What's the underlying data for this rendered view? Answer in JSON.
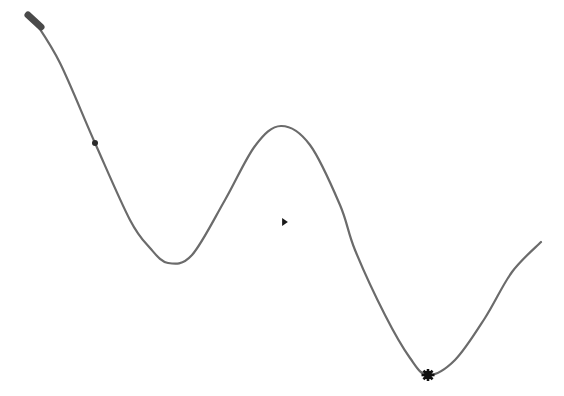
{
  "canvas": {
    "width": 564,
    "height": 396,
    "background_color": "#ffffff",
    "title": ""
  },
  "chart_data": {
    "type": "line",
    "title": "",
    "subtitle": "",
    "xlabel": "",
    "ylabel": "",
    "grid": false,
    "legend": false,
    "legend_position": "none",
    "axes_visible": false,
    "tick_labels_x": [],
    "tick_labels_y": [],
    "xlim": [
      0,
      564
    ],
    "ylim": [
      396,
      0
    ],
    "series": [
      {
        "name": "curve",
        "stroke_color": "#6b6b6b",
        "stroke_width": 2.2,
        "smooth": true,
        "x": [
          34,
          60,
          95,
          130,
          150,
          168,
          192,
          225,
          255,
          281,
          310,
          340,
          355,
          385,
          410,
          428,
          455,
          485,
          512,
          541
        ],
        "y": [
          20,
          63,
          143,
          220,
          248,
          263,
          255,
          200,
          146,
          126,
          145,
          205,
          250,
          315,
          358,
          375,
          360,
          318,
          272,
          242
        ]
      }
    ],
    "key_points": [
      {
        "name": "start",
        "x": 34,
        "y": 20
      },
      {
        "name": "trough-1",
        "x": 168,
        "y": 263
      },
      {
        "name": "peak-1",
        "x": 281,
        "y": 126
      },
      {
        "name": "trough-2",
        "x": 428,
        "y": 375
      },
      {
        "name": "end",
        "x": 541,
        "y": 242
      }
    ],
    "markers": [
      {
        "name": "dot-marker",
        "shape": "circle",
        "x": 95,
        "y": 143,
        "size": 6,
        "color": "#2b2b2b",
        "on_curve": true
      },
      {
        "name": "triangle-marker",
        "shape": "right-triangle",
        "x": 285,
        "y": 222,
        "size": 8,
        "color": "#1a1a1a",
        "on_curve": false
      },
      {
        "name": "star-marker",
        "shape": "starburst",
        "x": 428,
        "y": 375,
        "size": 13,
        "color": "#111111",
        "on_curve": true
      }
    ],
    "start_cap": {
      "name": "start-cap",
      "x1": 28,
      "y1": 15,
      "x2": 41,
      "y2": 27,
      "width": 7,
      "color": "#4a4a4a"
    }
  }
}
